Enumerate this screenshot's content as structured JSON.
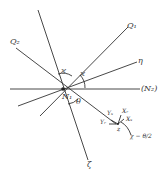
{
  "diagram": {
    "labels": {
      "q1": "Q₁",
      "q2": "Q₂",
      "eta": "η",
      "n2": "(N₂)",
      "n1": "N₁",
      "zeta": "ζ",
      "kappa_left": "ϰ",
      "kappa_right": "ϰ",
      "theta": "θ",
      "y_s": "Yₛ",
      "x_r": "Xᵣ",
      "x_s": "Xₛ",
      "y_r": "Yᵣ",
      "z": "z",
      "chi_formula": "χ − θ/2"
    },
    "colors": {
      "line": "#333333",
      "background": "#ffffff"
    }
  }
}
